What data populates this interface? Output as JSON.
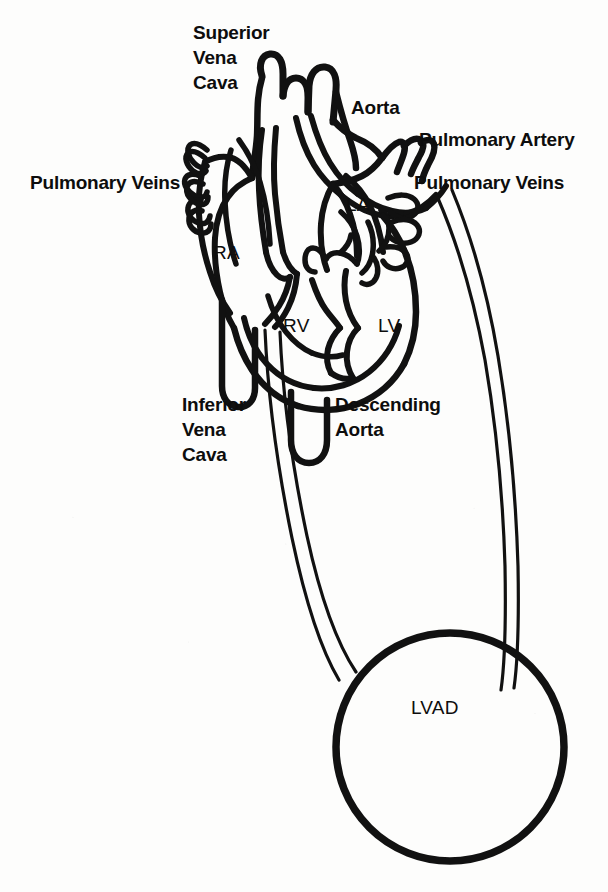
{
  "figure": {
    "kind": "anatomical-line-drawing",
    "background_color": "#fdfdfc",
    "ink_color": "#111111"
  },
  "labels": {
    "superior_vena_cava": "Superior\nVena\nCava",
    "aorta": "Aorta",
    "pulmonary_artery": "Pulmonary Artery",
    "pulmonary_veins_left": "Pulmonary Veins",
    "pulmonary_veins_right": "Pulmonary Veins",
    "inferior_vena_cava": "Inferior\nVena\nCava",
    "descending_aorta": "Descending\nAorta",
    "right_atrium": "RA",
    "right_ventricle": "RV",
    "left_atrium": "LA",
    "left_ventricle": "LV",
    "lvad": "LVAD"
  },
  "structures": {
    "device_shape": "circle",
    "cannula_count": 2,
    "cannula_description": "inflow and outflow cannulae connecting heart to LVAD"
  }
}
